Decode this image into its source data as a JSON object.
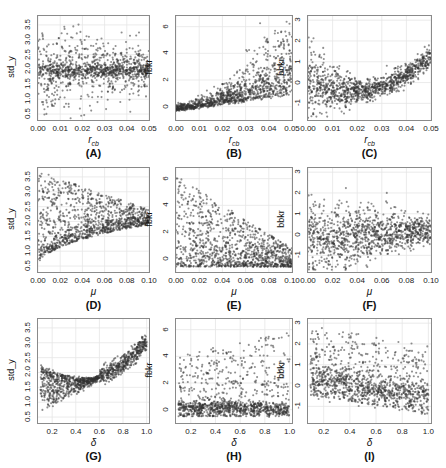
{
  "chart_data": [
    {
      "id": "A",
      "type": "scatter",
      "caption": "(A)",
      "xlabel": "r_cb",
      "ylabel": "std_y",
      "xlim": [
        0.0,
        0.05
      ],
      "ylim": [
        0.3,
        3.8
      ],
      "xticks": [
        "0.00",
        "0.01",
        "0.02",
        "0.03",
        "0.04",
        "0.05"
      ],
      "yticks": [
        "0.5",
        "1.0",
        "1.5",
        "2.0",
        "2.5",
        "3.0",
        "3.5"
      ],
      "trend": "flat band at ~1.9-2.0 with spread 0.5-3.6, spread narrowing slightly as r_cb grows",
      "grid": true
    },
    {
      "id": "B",
      "type": "scatter",
      "caption": "(B)",
      "xlabel": "r_cb",
      "ylabel": "fbkr",
      "xlim": [
        0.0,
        0.05
      ],
      "ylim": [
        -1,
        6.8
      ],
      "xticks": [
        "0.00",
        "0.01",
        "0.02",
        "0.03",
        "0.04",
        "0.05"
      ],
      "yticks": [
        "0",
        "2",
        "4",
        "6"
      ],
      "trend": "near 0 at low r_cb, fanning upward to 0-6.5 as r_cb approaches 0.05",
      "grid": true
    },
    {
      "id": "C",
      "type": "scatter",
      "caption": "(C)",
      "xlabel": "r_cb",
      "ylabel": "bbkr",
      "xlim": [
        0.0,
        0.05
      ],
      "ylim": [
        -1.8,
        3.2
      ],
      "xticks": [
        "0.00",
        "0.01",
        "0.02",
        "0.03",
        "0.04",
        "0.05"
      ],
      "yticks": [
        "-1",
        "0",
        "1",
        "2",
        "3"
      ],
      "trend": "U-shape: wide -1.6..2 near 0, minimum ~-0.3 at 0.02, rising to 1-3 near 0.05",
      "grid": true
    },
    {
      "id": "D",
      "type": "scatter",
      "caption": "(D)",
      "xlabel": "μ",
      "ylabel": "std_y",
      "xlim": [
        0.0,
        0.1
      ],
      "ylim": [
        0.3,
        3.8
      ],
      "xticks": [
        "0.00",
        "0.02",
        "0.04",
        "0.06",
        "0.08",
        "0.10"
      ],
      "yticks": [
        "0.5",
        "1.0",
        "1.5",
        "2.0",
        "2.5",
        "3.0",
        "3.5"
      ],
      "trend": "lower envelope rises from ~0.5 to ~1.9; dense band converging to ~2.0 at μ=0.1; upper scatter up to 3.7 at low μ",
      "grid": true
    },
    {
      "id": "E",
      "type": "scatter",
      "caption": "(E)",
      "xlabel": "μ",
      "ylabel": "fbkr",
      "xlim": [
        0.0,
        0.1
      ],
      "ylim": [
        -1,
        6.8
      ],
      "xticks": [
        "0.00",
        "0.02",
        "0.04",
        "0.06",
        "0.08",
        "0.10"
      ],
      "yticks": [
        "0",
        "2",
        "4",
        "6"
      ],
      "trend": "wide 0-6.4 at low μ, narrowing to ~0-1 as μ approaches 0.1",
      "grid": true
    },
    {
      "id": "F",
      "type": "scatter",
      "caption": "(F)",
      "xlabel": "μ",
      "ylabel": "bbkr",
      "xlim": [
        0.0,
        0.1
      ],
      "ylim": [
        -1.8,
        3.2
      ],
      "xticks": [
        "0.00",
        "0.02",
        "0.04",
        "0.06",
        "0.08",
        "0.10"
      ],
      "yticks": [
        "-1",
        "0",
        "1",
        "2",
        "3"
      ],
      "trend": "wide -1.6..3 at low μ, narrowing to 0..1 around 0.2-0.3 at μ=0.1",
      "grid": true
    },
    {
      "id": "G",
      "type": "scatter",
      "caption": "(G)",
      "xlabel": "δ",
      "ylabel": "std_y",
      "xlim": [
        0.08,
        1.02
      ],
      "ylim": [
        0.3,
        3.8
      ],
      "xticks": [
        "0.2",
        "0.4",
        "0.6",
        "0.8",
        "1.0"
      ],
      "yticks": [
        "0.5",
        "1.0",
        "1.5",
        "2.0",
        "2.5",
        "3.0",
        "3.5"
      ],
      "trend": "U-shaped upper band: ~2.4 at δ=0.1, minimum ~1.85 at δ=0.5, rising to ~3.7 at δ=1.0; lower scatter down to 0.4 at small δ",
      "grid": true
    },
    {
      "id": "H",
      "type": "scatter",
      "caption": "(H)",
      "xlabel": "δ",
      "ylabel": "fbkr",
      "xlim": [
        0.08,
        1.02
      ],
      "ylim": [
        -1,
        6.8
      ],
      "xticks": [
        "0.2",
        "0.4",
        "0.6",
        "0.8",
        "1.0"
      ],
      "yticks": [
        "0",
        "2",
        "4",
        "6"
      ],
      "trend": "dense band at ~0.2 across δ, scattered upward to ~6.5, upper spread increasing with δ",
      "grid": true
    },
    {
      "id": "I",
      "type": "scatter",
      "caption": "(I)",
      "xlabel": "δ",
      "ylabel": "bbkr",
      "xlim": [
        0.08,
        1.02
      ],
      "ylim": [
        -1.8,
        3.2
      ],
      "xticks": [
        "0.2",
        "0.4",
        "0.6",
        "0.8",
        "1.0"
      ],
      "yticks": [
        "-1",
        "0",
        "1",
        "2",
        "3"
      ],
      "trend": "dense band declining from ~0.3 at δ=0.1 to ~-0.6 at δ=1.0, scatter up to ~3",
      "grid": true
    }
  ]
}
